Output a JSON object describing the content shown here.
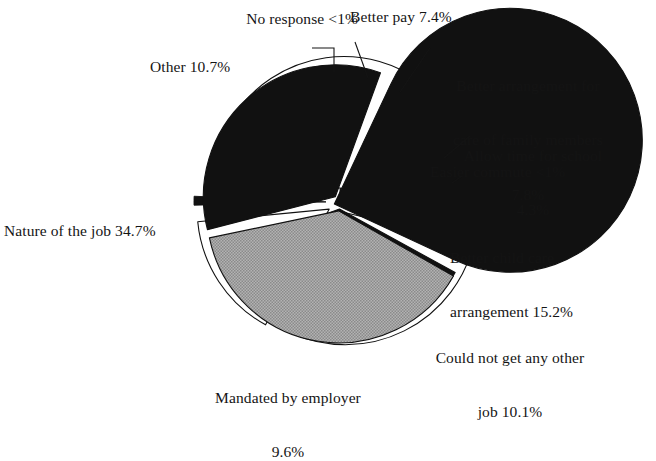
{
  "chart_data": {
    "type": "pie",
    "title": "",
    "subtitle": "",
    "xlabel": "",
    "ylabel": "",
    "legend_position": "none",
    "grid": false,
    "units": "percent",
    "total": 100,
    "exploded": true,
    "start_angle_deg": 0,
    "direction": "clockwise",
    "center_px": [
      340,
      202
    ],
    "radius_px": 132,
    "categories": [
      "No response",
      "Better pay",
      "Better arrangement for care of family members",
      "Allow time for school",
      "Easier commute",
      "Better child care arrangement",
      "Could not get any other job",
      "Mandated by employer",
      "Nature of the job",
      "Other"
    ],
    "values": [
      0.2,
      7.4,
      7.8,
      4.3,
      0.3,
      15.2,
      10.1,
      9.6,
      34.7,
      10.7
    ],
    "value_labels": [
      "<1%",
      "7.4%",
      "7.8%",
      "4.3%",
      "<1%",
      "15.2%",
      "10.1%",
      "9.6%",
      "34.7%",
      "10.7%"
    ],
    "slice_colors": [
      "#111111",
      "#ffffff",
      "#ffffff",
      "#ffffff",
      "#111111",
      "#ffffff",
      "#111111",
      "#111111",
      "#111111",
      "#a6a6a6"
    ],
    "slice_stroke": "#111111",
    "slices": [
      {
        "name": "no-response",
        "label": "No response",
        "value_label": "<1%",
        "value": 0.2,
        "fill": "#111111",
        "start": 0.0,
        "end": 0.72,
        "explode": 6,
        "leader": true
      },
      {
        "name": "better-pay",
        "label": "Better pay",
        "value_label": "7.4%",
        "value": 7.4,
        "fill": "#ffffff",
        "start": 0.72,
        "end": 27.36,
        "explode": 7,
        "leader": true
      },
      {
        "name": "family-care",
        "label": "Better arrangement for care of family members",
        "value_label": "7.8%",
        "value": 7.8,
        "fill": "#ffffff",
        "start": 28.6,
        "end": 56.68,
        "explode": 12,
        "leader": true
      },
      {
        "name": "allow-school",
        "label": "Allow time for school",
        "value_label": "4.3%",
        "value": 4.3,
        "fill": "#ffffff",
        "start": 58.0,
        "end": 73.48,
        "explode": 13,
        "leader": true
      },
      {
        "name": "easier-commute",
        "label": "Easier commute",
        "value_label": "<1%",
        "value": 0.3,
        "fill": "#111111",
        "start": 74.6,
        "end": 75.68,
        "explode": 14,
        "leader": true
      },
      {
        "name": "child-care",
        "label": "Better child care arrangement",
        "value_label": "15.2%",
        "value": 15.2,
        "fill": "#ffffff",
        "start": 77.0,
        "end": 131.72,
        "explode": 14,
        "leader": false
      },
      {
        "name": "could-not-get",
        "label": "Could not get any other job",
        "value_label": "10.1%",
        "value": 10.1,
        "fill": "#111111",
        "start": 133.0,
        "end": 169.36,
        "explode": 7,
        "leader": false
      },
      {
        "name": "mandated",
        "label": "Mandated by employer",
        "value_label": "9.6%",
        "value": 9.6,
        "fill": "#111111",
        "start": 171.0,
        "end": 205.56,
        "explode": 7,
        "leader": false
      },
      {
        "name": "nature-of-job",
        "label": "Nature of the job",
        "value_label": "34.7%",
        "value": 34.7,
        "fill": "#111111",
        "start": 207.0,
        "end": 331.92,
        "explode": 6,
        "leader": false
      },
      {
        "name": "other",
        "label": "Other",
        "value_label": "10.7%",
        "value": 10.7,
        "fill": "#a6a6a6",
        "start": 333.2,
        "end": 371.72,
        "explode": 9,
        "leader": false
      }
    ]
  },
  "labels": {
    "no_response": "No response <1%",
    "better_pay": "Better pay 7.4%",
    "family_care_l1": "Better arrangement for",
    "family_care_l2": "care of family members",
    "family_care_l3": "7.8%",
    "allow_school_l1": "Allow time for school",
    "allow_school_l2": "4.3%",
    "easier_commute": "Easier commute <1%",
    "child_care_l1": "Better child care",
    "child_care_l2": "arrangement 15.2%",
    "could_not_l1": "Could not get any other",
    "could_not_l2": "job 10.1%",
    "mandated_l1": "Mandated by employer",
    "mandated_l2": "9.6%",
    "nature_of_job": "Nature of the job 34.7%",
    "other": "Other 10.7%"
  },
  "colors": {
    "background": "#ffffff",
    "ink": "#141414",
    "slice_black": "#111111",
    "slice_white": "#ffffff",
    "slice_gray": "#a6a6a6",
    "outline": "#111111"
  }
}
